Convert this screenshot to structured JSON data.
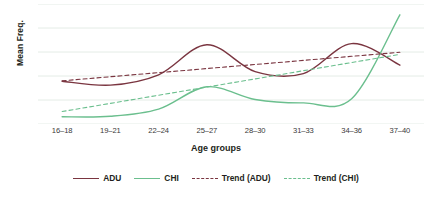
{
  "chart_data": {
    "type": "line",
    "title": "",
    "xlabel": "Age groups",
    "ylabel": "Mean Freq.",
    "categories": [
      "16–18",
      "19–21",
      "22–24",
      "25–27",
      "28–30",
      "31–33",
      "34–36",
      "37–40"
    ],
    "ylim": [
      0,
      5
    ],
    "yticks_visible": false,
    "grid": "horizontal",
    "legend_position": "bottom",
    "series": [
      {
        "name": "ADU",
        "style": "solid",
        "color": "#7a3540",
        "values": [
          1.78,
          1.62,
          2.05,
          3.3,
          2.18,
          2.1,
          3.35,
          2.45
        ]
      },
      {
        "name": "CHI",
        "style": "solid",
        "color": "#6bbf8e",
        "values": [
          0.3,
          0.32,
          0.62,
          1.55,
          1.02,
          0.88,
          1.05,
          4.55
        ]
      },
      {
        "name": "Trend (ADU)",
        "style": "dashed",
        "color": "#7a3540",
        "values": [
          1.8,
          1.97,
          2.14,
          2.31,
          2.48,
          2.65,
          2.82,
          2.99
        ]
      },
      {
        "name": "Trend (CHI)",
        "style": "dashed",
        "color": "#6bbf8e",
        "values": [
          0.52,
          0.86,
          1.2,
          1.54,
          1.88,
          2.22,
          2.56,
          2.9
        ]
      }
    ]
  },
  "axes": {
    "y_title": "Mean Freq.",
    "x_title": "Age groups"
  },
  "legend": {
    "items": [
      {
        "label": "ADU",
        "color": "#7a3540",
        "style": "solid"
      },
      {
        "label": "CHI",
        "color": "#6bbf8e",
        "style": "solid"
      },
      {
        "label": "Trend (ADU)",
        "color": "#7a3540",
        "style": "dashed"
      },
      {
        "label": "Trend (CHI)",
        "color": "#6bbf8e",
        "style": "dashed"
      }
    ]
  },
  "colors": {
    "adu": "#7a3540",
    "chi": "#6bbf8e",
    "grid": "#e4ece6",
    "text": "#231f20"
  }
}
